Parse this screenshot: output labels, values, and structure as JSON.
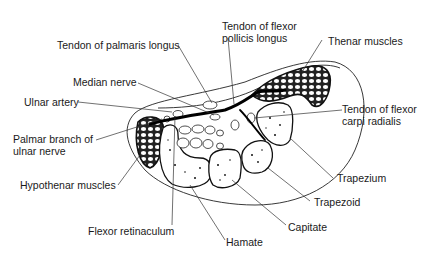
{
  "diagram": {
    "labels": {
      "tendon_palmaris_longus": "Tendon of palmaris longus",
      "tendon_fpl_line1": "Tendon of flexor",
      "tendon_fpl_line2": "pollicis longus",
      "thenar_muscles": "Thenar muscles",
      "median_nerve": "Median nerve",
      "ulnar_artery": "Ulnar artery",
      "tendon_fcr_line1": "Tendon of flexor",
      "tendon_fcr_line2": "carpi radialis",
      "palmar_branch_line1": "Palmar branch of",
      "palmar_branch_line2": "ulnar nerve",
      "hypothenar_muscles": "Hypothenar muscles",
      "trapezium": "Trapezium",
      "trapezoid": "Trapezoid",
      "capitate": "Capitate",
      "flexor_retinaculum": "Flexor retinaculum",
      "hamate": "Hamate"
    }
  }
}
